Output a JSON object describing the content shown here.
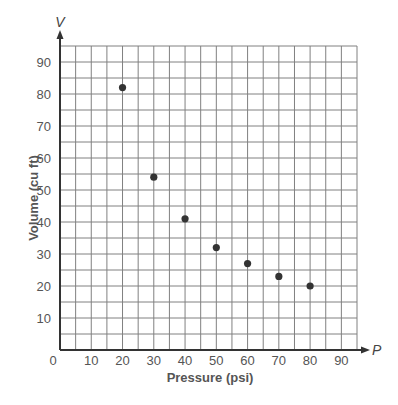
{
  "chart_data": {
    "type": "scatter",
    "title": "",
    "xlabel": "Pressure (psi)",
    "ylabel": "Volume (cu ft)",
    "x_axis_variable": "P",
    "y_axis_variable": "V",
    "x": [
      20,
      30,
      40,
      50,
      60,
      70,
      80
    ],
    "y": [
      82,
      54,
      41,
      32,
      27,
      23,
      20
    ],
    "series": [
      {
        "name": "Volume vs Pressure",
        "x": [
          20,
          30,
          40,
          50,
          60,
          70,
          80
        ],
        "y": [
          82,
          54,
          41,
          32,
          27,
          23,
          20
        ]
      }
    ],
    "xlim": [
      0,
      95
    ],
    "ylim": [
      0,
      95
    ],
    "x_ticks": [
      0,
      10,
      20,
      30,
      40,
      50,
      60,
      70,
      80,
      90
    ],
    "y_ticks": [
      10,
      20,
      30,
      40,
      50,
      60,
      70,
      80,
      90
    ],
    "origin_label": "0",
    "grid": true,
    "grid_step": 5,
    "legend": null,
    "colors": {
      "points": "#333333",
      "grid": "#808080",
      "axes": "#333333"
    }
  }
}
